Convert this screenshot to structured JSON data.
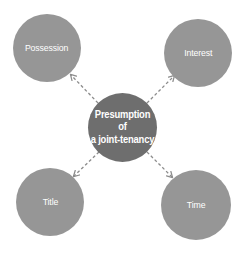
{
  "diagram": {
    "type": "hub-and-spoke",
    "background_color": "#ffffff",
    "center": {
      "id": "presumption",
      "label_line_1": "Presumption of",
      "label_line_2": "a joint-tenancy",
      "fill_color": "#6e6e6e",
      "text_color": "#ffffff"
    },
    "satellites": [
      {
        "id": "possession",
        "label": "Possession",
        "position": "top-left",
        "fill_color": "#969696",
        "text_color": "#ffffff"
      },
      {
        "id": "interest",
        "label": "Interest",
        "position": "top-right",
        "fill_color": "#969696",
        "text_color": "#ffffff"
      },
      {
        "id": "title",
        "label": "Title",
        "position": "bottom-left",
        "fill_color": "#969696",
        "text_color": "#ffffff"
      },
      {
        "id": "time",
        "label": "Time",
        "position": "bottom-right",
        "fill_color": "#969696",
        "text_color": "#ffffff"
      }
    ],
    "connectors": {
      "style": "dashed",
      "color": "#8c8c8c",
      "arrowhead": "open-v",
      "direction": "center-to-satellite",
      "count": 4
    }
  }
}
